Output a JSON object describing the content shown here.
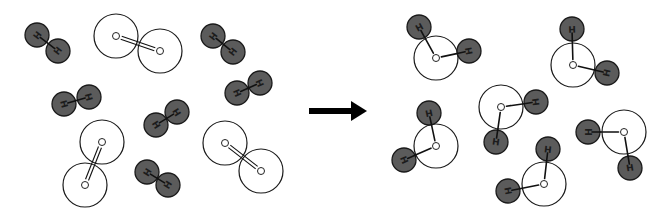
{
  "diagram": {
    "colors": {
      "hydrogen_fill": "#5b5b5b",
      "outline": "#1a1a1a",
      "oxygen_fill": "#ffffff",
      "arrow": "#000000"
    },
    "atom_labels": {
      "hydrogen": "H",
      "oxygen": "O"
    },
    "radii": {
      "hydrogen": 12,
      "oxygen": 22,
      "oxygen_label": 3.5
    },
    "reactants": {
      "hydrogen_molecules": [
        {
          "a": [
            37,
            35
          ],
          "b": [
            58,
            51
          ]
        },
        {
          "a": [
            213,
            36
          ],
          "b": [
            233,
            52
          ]
        },
        {
          "a": [
            237,
            93
          ],
          "b": [
            260,
            83
          ]
        },
        {
          "a": [
            64,
            104
          ],
          "b": [
            89,
            97
          ]
        },
        {
          "a": [
            156,
            125
          ],
          "b": [
            177,
            112
          ]
        },
        {
          "a": [
            147,
            172
          ],
          "b": [
            168,
            185
          ]
        }
      ],
      "oxygen_molecules": [
        {
          "a": [
            116,
            36
          ],
          "b": [
            160,
            51
          ]
        },
        {
          "a": [
            102,
            142
          ],
          "b": [
            85,
            185
          ]
        },
        {
          "a": [
            225,
            143
          ],
          "b": [
            261,
            171
          ]
        }
      ]
    },
    "arrow": {
      "x1": 309,
      "x2": 367,
      "y": 111,
      "label": "yields"
    },
    "products": {
      "water_molecules": [
        {
          "o": [
            436,
            58
          ],
          "h1": [
            419,
            27
          ],
          "h2": [
            469,
            51
          ]
        },
        {
          "o": [
            573,
            65
          ],
          "h1": [
            572,
            29
          ],
          "h2": [
            607,
            73
          ]
        },
        {
          "o": [
            436,
            146
          ],
          "h1": [
            429,
            113
          ],
          "h2": [
            404,
            160
          ]
        },
        {
          "o": [
            501,
            107
          ],
          "h1": [
            536,
            102
          ],
          "h2": [
            496,
            142
          ]
        },
        {
          "o": [
            544,
            184
          ],
          "h1": [
            548,
            149
          ],
          "h2": [
            508,
            191
          ]
        },
        {
          "o": [
            624,
            132
          ],
          "h1": [
            588,
            132
          ],
          "h2": [
            630,
            168
          ]
        }
      ]
    }
  }
}
